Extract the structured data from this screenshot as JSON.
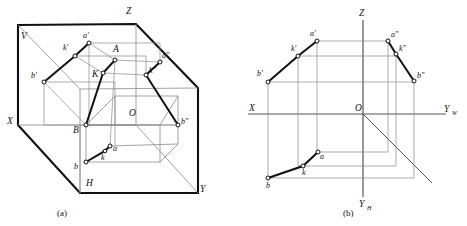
{
  "figure": {
    "title": "",
    "panels": [
      {
        "id": "a",
        "caption": "(a)",
        "labels": {
          "axis_x": "X",
          "axis_y": "Y",
          "axis_z": "Z",
          "plane_v": "V",
          "plane_h": "H",
          "origin": "O",
          "point_A": "A",
          "point_B": "B",
          "point_K": "K",
          "a_prime": "a'",
          "b_prime": "b'",
          "k_prime": "k'",
          "a_dprime": "a\"",
          "b_dprime": "b\"",
          "k_dprime": "k\"",
          "a_low": "a",
          "b_low": "b",
          "k_low": "k"
        }
      },
      {
        "id": "b",
        "caption": "(b)",
        "labels": {
          "axis_x": "X",
          "axis_z": "Z",
          "axis_yw": "Y",
          "axis_yw_sub": "W",
          "axis_yh": "Y",
          "axis_yh_sub": "H",
          "origin": "O",
          "a_prime": "a'",
          "b_prime": "b'",
          "k_prime": "k'",
          "a_dprime": "a\"",
          "b_dprime": "b\"",
          "k_dprime": "k\"",
          "a_low": "a",
          "b_low": "b",
          "k_low": "k"
        }
      }
    ],
    "colors": {
      "stroke_heavy": "#111111",
      "stroke_light": "#8a8a8a",
      "stroke_medium": "#444444",
      "vertex_fill": "#ffffff",
      "background": "#ffffff"
    }
  }
}
